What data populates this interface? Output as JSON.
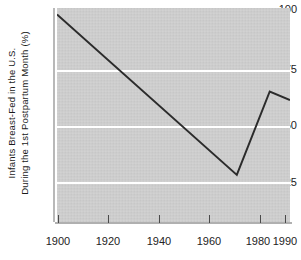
{
  "chart_data": {
    "type": "line",
    "title": "",
    "xlabel": "",
    "ylabel_line1": "Infants Breast-Fed in the U.S.",
    "ylabel_line2": "During the 1st Postpartum Month (%)",
    "xlim": [
      1900,
      1992
    ],
    "ylim": [
      0,
      100
    ],
    "grid": "horizontal",
    "legend": "none",
    "x_ticks": [
      1900,
      1920,
      1940,
      1960,
      1980,
      1990
    ],
    "x_tick_labels": [
      "1900",
      "1920",
      "1940",
      "1960",
      "1980",
      "1990"
    ],
    "y_ticks": [
      25,
      50,
      75,
      100
    ],
    "y_tick_labels": [
      "25",
      "50",
      "75",
      "100"
    ],
    "series": [
      {
        "name": "Infants Breast-Fed",
        "color": "#2b2b2b",
        "x": [
          1900,
          1971,
          1984,
          1992
        ],
        "values": [
          97,
          22,
          61,
          57
        ]
      }
    ],
    "plot_background": "#cfcfcf",
    "gridline_color": "#ffffff",
    "line_color": "#2b2b2b"
  }
}
